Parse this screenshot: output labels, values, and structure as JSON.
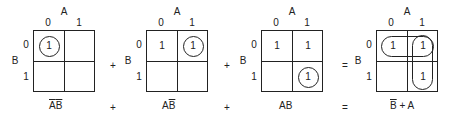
{
  "labels": {
    "var_a": "A",
    "var_b": "B",
    "col_0": "0",
    "col_1": "1",
    "row_0": "0",
    "row_1": "1",
    "one": "1"
  },
  "operators": {
    "plus": "+",
    "equals": "="
  },
  "maps": [
    {
      "id": "map-1",
      "cells": {
        "r0c0": "1",
        "r0c1": "",
        "r1c0": "",
        "r1c1": ""
      },
      "circled": [
        "r0c0"
      ],
      "expression": {
        "part1": "A",
        "part1_overline": true,
        "part2": "B",
        "part2_overline": true
      }
    },
    {
      "id": "map-2",
      "cells": {
        "r0c0": "1",
        "r0c1": "1",
        "r1c0": "",
        "r1c1": ""
      },
      "circled": [
        "r0c1"
      ],
      "expression": {
        "part1": "A",
        "part1_overline": false,
        "part2": "B",
        "part2_overline": true
      }
    },
    {
      "id": "map-3",
      "cells": {
        "r0c0": "1",
        "r0c1": "1",
        "r1c0": "",
        "r1c1": "1"
      },
      "circled": [
        "r1c1"
      ],
      "expression": {
        "part1": "A",
        "part1_overline": false,
        "part2": "B",
        "part2_overline": false
      }
    },
    {
      "id": "map-4",
      "cells": {
        "r0c0": "1",
        "r0c1": "1",
        "r1c0": "",
        "r1c1": "1"
      },
      "loops": [
        "row-0",
        "col-1"
      ],
      "expression": {
        "part1": "B",
        "part1_overline": true,
        "op": " + ",
        "part2": "A",
        "part2_overline": false
      }
    }
  ]
}
